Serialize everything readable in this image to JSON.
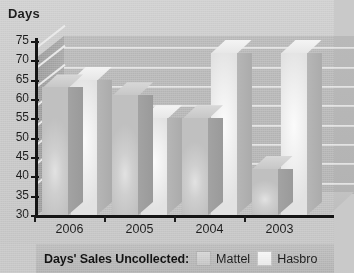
{
  "chart_data": {
    "type": "bar",
    "title": "",
    "ylabel": "Days",
    "xlabel": "",
    "categories": [
      "2006",
      "2005",
      "2004",
      "2003"
    ],
    "series": [
      {
        "name": "Mattel",
        "values": [
          63,
          61,
          55,
          42
        ],
        "color": "#cfcfcf"
      },
      {
        "name": "Hasbro",
        "values": [
          65,
          55,
          72,
          72
        ],
        "color": "#f0f0f0"
      }
    ],
    "ylim": [
      30,
      75
    ],
    "yticks": [
      30,
      35,
      40,
      45,
      50,
      55,
      60,
      65,
      70,
      75
    ],
    "grid": true,
    "legend_position": "bottom",
    "legend_title": "Days' Sales Uncollected:",
    "style": "3d-clustered-column",
    "note_cropped_right": true
  },
  "axis": {
    "y_title": "Days",
    "y_tick_labels": [
      "75",
      "70",
      "65",
      "60",
      "55",
      "50",
      "45",
      "40",
      "35",
      "30"
    ],
    "x_tick_labels": [
      "2006",
      "2005",
      "2004",
      "2003"
    ]
  },
  "legend": {
    "title": "Days' Sales Uncollected:",
    "entries": [
      {
        "label": "Mattel",
        "swatch": "mattel-swatch"
      },
      {
        "label": "Hasbro",
        "swatch": "hasbro-swatch"
      }
    ]
  }
}
